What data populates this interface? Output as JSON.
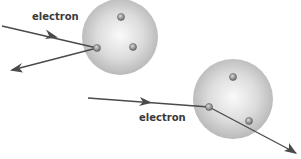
{
  "diagram": {
    "labels": {
      "electron_top": "electron",
      "electron_bottom": "electron"
    },
    "colors": {
      "arrow": "#4a4a4a",
      "atom_light": "#f4f4f4",
      "atom_dark": "#b8b8b8",
      "particle": "#8a8a8a",
      "label": "#3a3a3a"
    },
    "atoms": [
      {
        "name": "atom-top-left",
        "cx": 120,
        "cy": 37,
        "r": 38,
        "particles": [
          [
            121,
            17
          ],
          [
            133,
            47
          ],
          [
            97,
            48
          ]
        ]
      },
      {
        "name": "atom-bottom-right",
        "cx": 233,
        "cy": 99,
        "r": 40,
        "particles": [
          [
            233,
            77
          ],
          [
            249,
            121
          ],
          [
            209,
            107
          ]
        ]
      }
    ]
  }
}
